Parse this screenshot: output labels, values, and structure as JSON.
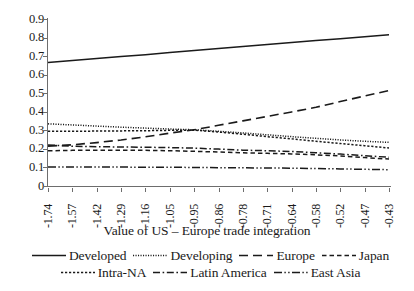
{
  "chart_data": {
    "type": "line",
    "title": "",
    "xlabel": "Value of US – Europe trade integration",
    "ylabel": "",
    "ylim": [
      0,
      0.9
    ],
    "ytick_labels": [
      "0.9",
      "0.8",
      "0.7",
      "0.6",
      "0.5",
      "0.4",
      "0.3",
      "0.2",
      "0.1",
      "0"
    ],
    "ytick_values": [
      0.9,
      0.8,
      0.7,
      0.6,
      0.5,
      0.4,
      0.3,
      0.2,
      0.1,
      0
    ],
    "grid": false,
    "legend_position": "bottom",
    "categories": [
      "-1.74",
      "-1.57",
      "-1.42",
      "-1.29",
      "-1.16",
      "-1.05",
      "-0.95",
      "-0.86",
      "-0.78",
      "-0.71",
      "-0.64",
      "-0.58",
      "-0.52",
      "-0.47",
      "-0.43"
    ],
    "series": [
      {
        "name": "Developed",
        "style": "solid",
        "values": [
          0.665,
          0.676,
          0.687,
          0.698,
          0.708,
          0.719,
          0.73,
          0.741,
          0.752,
          0.762,
          0.773,
          0.784,
          0.794,
          0.805,
          0.815
        ]
      },
      {
        "name": "Developing",
        "style": "fine-dotted",
        "values": [
          0.335,
          0.329,
          0.323,
          0.317,
          0.312,
          0.307,
          0.303,
          0.295,
          0.286,
          0.276,
          0.266,
          0.257,
          0.248,
          0.241,
          0.235
        ]
      },
      {
        "name": "Europe",
        "style": "long-dash",
        "values": [
          0.215,
          0.222,
          0.234,
          0.248,
          0.265,
          0.285,
          0.303,
          0.327,
          0.351,
          0.375,
          0.399,
          0.424,
          0.455,
          0.485,
          0.515
        ]
      },
      {
        "name": "Japan",
        "style": "short-dash",
        "values": [
          0.19,
          0.192,
          0.193,
          0.193,
          0.192,
          0.19,
          0.187,
          0.183,
          0.179,
          0.176,
          0.173,
          0.168,
          0.162,
          0.153,
          0.145
        ]
      },
      {
        "name": "Intra-NA",
        "style": "dotted",
        "values": [
          0.295,
          0.295,
          0.296,
          0.297,
          0.298,
          0.3,
          0.301,
          0.291,
          0.279,
          0.266,
          0.254,
          0.241,
          0.229,
          0.217,
          0.205
        ]
      },
      {
        "name": "Latin America",
        "style": "dash-dot",
        "values": [
          0.221,
          0.214,
          0.212,
          0.21,
          0.209,
          0.207,
          0.204,
          0.199,
          0.193,
          0.19,
          0.186,
          0.179,
          0.172,
          0.163,
          0.155
        ]
      },
      {
        "name": "East Asia",
        "style": "dash-dot-dot",
        "values": [
          0.103,
          0.103,
          0.102,
          0.102,
          0.101,
          0.101,
          0.1,
          0.099,
          0.098,
          0.097,
          0.096,
          0.094,
          0.092,
          0.09,
          0.088
        ]
      }
    ]
  },
  "legend": {
    "row1": [
      {
        "label": "Developed",
        "style": "solid"
      },
      {
        "label": "Developing",
        "style": "fine-dotted"
      },
      {
        "label": "Europe",
        "style": "long-dash"
      },
      {
        "label": "Japan",
        "style": "short-dash"
      }
    ],
    "row2": [
      {
        "label": "Intra-NA",
        "style": "dotted"
      },
      {
        "label": "Latin America",
        "style": "dash-dot"
      },
      {
        "label": "East Asia",
        "style": "dash-dot-dot"
      }
    ]
  },
  "colors": {
    "line": "#1a1a1a",
    "axis": "#6d6d6d",
    "background": "#ffffff",
    "text": "#1a1a1a"
  }
}
